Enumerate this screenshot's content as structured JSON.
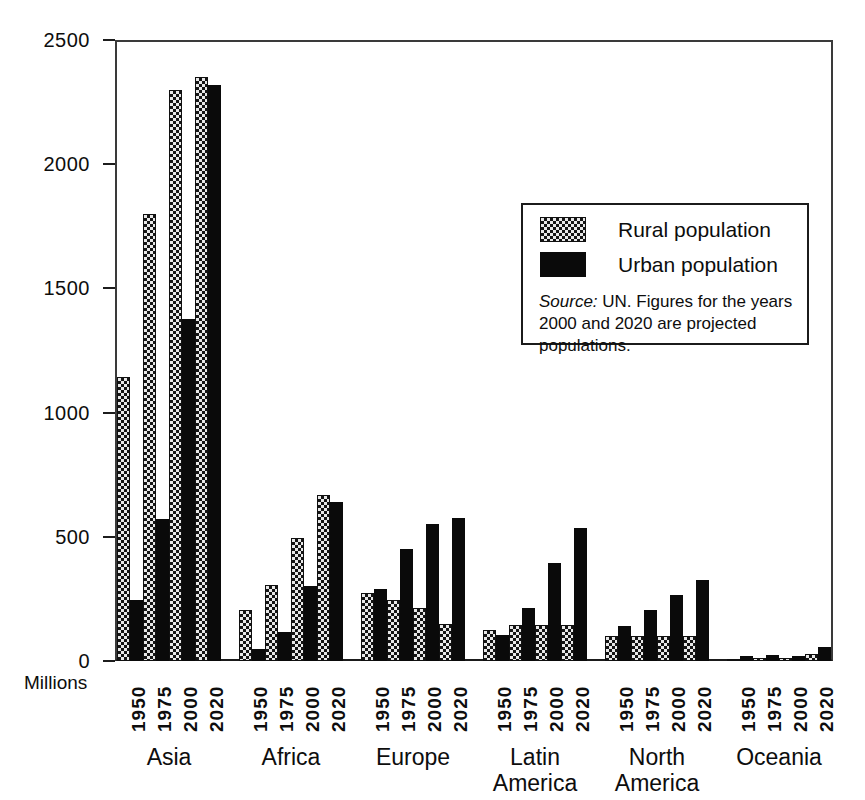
{
  "chart_data": {
    "type": "bar",
    "title": "",
    "xlabel": "",
    "ylabel": "Millions",
    "ylim": [
      0,
      2500
    ],
    "yticks": [
      0,
      500,
      1000,
      1500,
      2000,
      2500
    ],
    "grid": true,
    "legend_position": "inside-upper-right",
    "categories": [
      "1950",
      "1975",
      "2000",
      "2020"
    ],
    "groups": [
      "Asia",
      "Africa",
      "Europe",
      "Latin America",
      "North America",
      "Oceania"
    ],
    "series": [
      {
        "name": "Rural population",
        "color": "#e8e8e8",
        "pattern": "cross-hatch",
        "values_by_group": {
          "Asia": [
            1145,
            1800,
            2300,
            2350
          ],
          "Africa": [
            205,
            305,
            495,
            670
          ],
          "Europe": [
            275,
            245,
            215,
            150
          ],
          "Latin America": [
            125,
            145,
            145,
            145
          ],
          "North America": [
            100,
            100,
            100,
            100
          ],
          "Oceania": [
            10,
            12,
            14,
            30
          ]
        }
      },
      {
        "name": "Urban population",
        "color": "#0a0a0a",
        "pattern": "solid",
        "values_by_group": {
          "Asia": [
            245,
            570,
            1375,
            2320
          ],
          "Africa": [
            50,
            115,
            300,
            640
          ],
          "Europe": [
            290,
            450,
            550,
            575
          ],
          "Latin America": [
            105,
            215,
            395,
            535
          ],
          "North America": [
            140,
            205,
            265,
            325
          ],
          "Oceania": [
            22,
            25,
            22,
            55
          ]
        }
      }
    ]
  },
  "axis": {
    "y_unit_label": "Millions",
    "y_tick_labels": [
      "2500",
      "2000",
      "1500",
      "1000",
      "500",
      "0"
    ]
  },
  "legend": {
    "items": [
      {
        "label": "Rural population",
        "swatch": "rural"
      },
      {
        "label": "Urban population",
        "swatch": "urban"
      }
    ],
    "source_prefix": "Source:",
    "source_text": " UN. Figures for the years 2000 and 2020 are projected populations."
  },
  "region_labels": [
    {
      "line1": "Asia",
      "line2": ""
    },
    {
      "line1": "Africa",
      "line2": ""
    },
    {
      "line1": "Europe",
      "line2": ""
    },
    {
      "line1": "Latin",
      "line2": "America"
    },
    {
      "line1": "North",
      "line2": "America"
    },
    {
      "line1": "Oceania",
      "line2": ""
    }
  ]
}
